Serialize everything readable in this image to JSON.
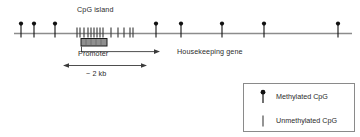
{
  "figure": {
    "type": "biology-diagram",
    "labels": {
      "cpg_island": "CpG island",
      "promoter": "Promoter",
      "housekeeping_gene": "Housekeeping gene",
      "scale": "~ 2 kb"
    },
    "legend": {
      "items": [
        {
          "glyph": "lollipop-filled-icon",
          "label": "Methylated CpG"
        },
        {
          "glyph": "tick-line-icon",
          "label": "Unmethylated CpG"
        }
      ]
    },
    "colors": {
      "dna_line": "#8c8c8c",
      "methylated": "#111111",
      "unmethylated": "#3d3d3d",
      "promoter_box_fill": "#8f8f8f",
      "promoter_box_stroke": "#1a1a1a",
      "legend_border": "#8a8a8a",
      "text": "#2b2b2b"
    }
  },
  "chart_data": {
    "type": "scatter",
    "xlabel": "",
    "ylabel": "",
    "axis_line_y": 33,
    "xlim": [
      14,
      352
    ],
    "series": [
      {
        "name": "Methylated CpG",
        "marker": "lollipop-filled",
        "x": [
          21,
          34,
          55,
          156,
          181,
          222,
          264,
          338
        ]
      },
      {
        "name": "Unmethylated CpG",
        "marker": "tick-line",
        "x": [
          77,
          80,
          84,
          88,
          91,
          94,
          97,
          100,
          103,
          111,
          118,
          124,
          130,
          133
        ]
      }
    ],
    "regions": [
      {
        "name": "CpG island",
        "x_start": 76,
        "x_end": 134
      },
      {
        "name": "Promoter",
        "x_start": 81,
        "x_end": 107
      },
      {
        "name": "Transcription arrow",
        "x_start": 81,
        "x_end": 158,
        "direction": "right"
      },
      {
        "name": "~ 2 kb scale",
        "x_start": 64,
        "x_end": 146,
        "direction": "both"
      }
    ]
  }
}
